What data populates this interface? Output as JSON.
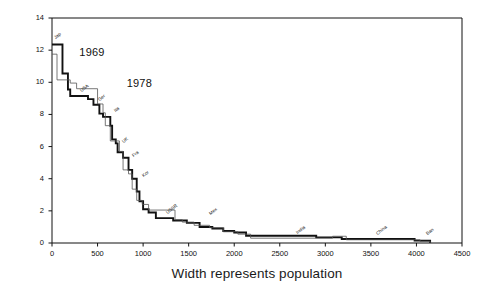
{
  "chart_data": {
    "type": "line",
    "title": "",
    "xlabel": "Width represents population",
    "ylabel": "Hourly wages (1985 dollars)",
    "xlim": [
      0,
      4500
    ],
    "ylim": [
      0,
      14
    ],
    "grid": false,
    "legend": "inline-annotations",
    "xticks": [
      "0",
      "500",
      "1000",
      "1500",
      "2000",
      "2500",
      "3000",
      "3500",
      "4000",
      "4500"
    ],
    "yticks": [
      "0",
      "2",
      "4",
      "6",
      "8",
      "10",
      "12",
      "14"
    ],
    "annotations": [
      {
        "text": "1969",
        "x": 300,
        "y": 11.8
      },
      {
        "text": "1978",
        "x": 820,
        "y": 9.9
      }
    ],
    "country_labels": [
      {
        "text": "Jap",
        "x": 40,
        "y": 12.6
      },
      {
        "text": "USA",
        "x": 330,
        "y": 9.3
      },
      {
        "text": "Ger",
        "x": 530,
        "y": 8.7
      },
      {
        "text": "Ita",
        "x": 700,
        "y": 8.0
      },
      {
        "text": "UK",
        "x": 790,
        "y": 6.1
      },
      {
        "text": "Fra",
        "x": 905,
        "y": 5.2
      },
      {
        "text": "Kor",
        "x": 1010,
        "y": 4.0
      },
      {
        "text": "USSR",
        "x": 1270,
        "y": 1.65
      },
      {
        "text": "Mex",
        "x": 1750,
        "y": 1.6
      },
      {
        "text": "India",
        "x": 2700,
        "y": 0.45
      },
      {
        "text": "China",
        "x": 3580,
        "y": 0.4
      },
      {
        "text": "Ban",
        "x": 4130,
        "y": 0.4
      }
    ],
    "series": [
      {
        "name": "1969",
        "style": "thick-dark-step",
        "color": "#111111",
        "points": [
          [
            0,
            12.35
          ],
          [
            115,
            12.35
          ],
          [
            115,
            10.55
          ],
          [
            175,
            10.55
          ],
          [
            175,
            9.55
          ],
          [
            200,
            9.55
          ],
          [
            200,
            9.15
          ],
          [
            395,
            9.15
          ],
          [
            395,
            8.95
          ],
          [
            455,
            8.95
          ],
          [
            455,
            8.6
          ],
          [
            520,
            8.6
          ],
          [
            520,
            8.05
          ],
          [
            560,
            8.05
          ],
          [
            560,
            7.85
          ],
          [
            640,
            7.85
          ],
          [
            640,
            7.3
          ],
          [
            660,
            7.3
          ],
          [
            660,
            6.45
          ],
          [
            700,
            6.45
          ],
          [
            700,
            6.2
          ],
          [
            720,
            6.2
          ],
          [
            720,
            5.65
          ],
          [
            780,
            5.65
          ],
          [
            780,
            5.3
          ],
          [
            840,
            5.3
          ],
          [
            840,
            4.55
          ],
          [
            880,
            4.55
          ],
          [
            880,
            4.0
          ],
          [
            930,
            4.0
          ],
          [
            930,
            3.2
          ],
          [
            960,
            3.2
          ],
          [
            960,
            2.6
          ],
          [
            1000,
            2.6
          ],
          [
            1000,
            2.1
          ],
          [
            1060,
            2.1
          ],
          [
            1060,
            1.9
          ],
          [
            1140,
            1.9
          ],
          [
            1140,
            1.55
          ],
          [
            1330,
            1.55
          ],
          [
            1330,
            1.4
          ],
          [
            1480,
            1.4
          ],
          [
            1480,
            1.25
          ],
          [
            1620,
            1.25
          ],
          [
            1620,
            1.0
          ],
          [
            1760,
            1.0
          ],
          [
            1760,
            0.9
          ],
          [
            1880,
            0.9
          ],
          [
            1880,
            0.75
          ],
          [
            2000,
            0.75
          ],
          [
            2000,
            0.65
          ],
          [
            2130,
            0.65
          ],
          [
            2130,
            0.45
          ],
          [
            2900,
            0.45
          ],
          [
            2900,
            0.35
          ],
          [
            3180,
            0.35
          ],
          [
            3180,
            0.25
          ],
          [
            3980,
            0.25
          ],
          [
            3980,
            0.15
          ],
          [
            4150,
            0.15
          ],
          [
            4150,
            0.0
          ]
        ]
      },
      {
        "name": "1978",
        "style": "thin-step",
        "color": "#555555",
        "points": [
          [
            0,
            11.75
          ],
          [
            55,
            11.75
          ],
          [
            55,
            10.15
          ],
          [
            200,
            10.15
          ],
          [
            200,
            9.95
          ],
          [
            270,
            9.95
          ],
          [
            270,
            9.6
          ],
          [
            500,
            9.6
          ],
          [
            500,
            8.65
          ],
          [
            560,
            8.65
          ],
          [
            560,
            8.1
          ],
          [
            585,
            8.1
          ],
          [
            585,
            7.3
          ],
          [
            640,
            7.3
          ],
          [
            640,
            6.35
          ],
          [
            740,
            6.35
          ],
          [
            740,
            5.7
          ],
          [
            780,
            5.7
          ],
          [
            780,
            4.55
          ],
          [
            840,
            4.55
          ],
          [
            840,
            4.3
          ],
          [
            880,
            4.3
          ],
          [
            880,
            3.35
          ],
          [
            930,
            3.35
          ],
          [
            930,
            2.65
          ],
          [
            990,
            2.65
          ],
          [
            990,
            2.4
          ],
          [
            1060,
            2.4
          ],
          [
            1060,
            2.05
          ],
          [
            1350,
            2.05
          ],
          [
            1350,
            1.45
          ],
          [
            1430,
            1.45
          ],
          [
            1430,
            1.3
          ],
          [
            1560,
            1.3
          ],
          [
            1560,
            1.1
          ],
          [
            1730,
            1.1
          ],
          [
            1730,
            0.95
          ],
          [
            1880,
            0.95
          ],
          [
            1880,
            0.7
          ],
          [
            2040,
            0.7
          ],
          [
            2040,
            0.55
          ],
          [
            2180,
            0.55
          ],
          [
            2180,
            0.3
          ],
          [
            3080,
            0.3
          ],
          [
            3080,
            0.42
          ],
          [
            3230,
            0.42
          ],
          [
            3230,
            0.2
          ],
          [
            4040,
            0.2
          ],
          [
            4040,
            0.1
          ],
          [
            4150,
            0.1
          ],
          [
            4150,
            0.0
          ]
        ]
      }
    ]
  }
}
